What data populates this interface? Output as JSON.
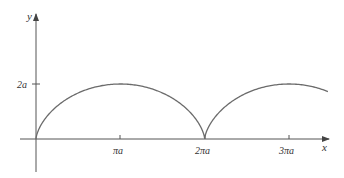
{
  "diagram": {
    "type": "parametric-curve",
    "axes": {
      "x_label": "x",
      "y_label": "y",
      "x_ticks": [
        {
          "label": "πa",
          "value_pi_a": 1
        },
        {
          "label": "2πa",
          "value_pi_a": 2
        },
        {
          "label": "3πa",
          "value_pi_a": 3
        }
      ],
      "y_ticks": [
        {
          "label": "2a",
          "value_a": 2
        }
      ]
    },
    "curve": {
      "color": "#6b6b6b",
      "t_range": [
        0,
        10.5
      ],
      "cusps_at_pi_a": [
        0,
        2
      ],
      "peaks_at_pi_a": [
        1,
        3
      ],
      "peak_height_a": 2
    },
    "colors": {
      "axis": "#555555",
      "curve": "#6b6b6b",
      "text": "#333333"
    }
  },
  "labels": {
    "y_axis": "y",
    "x_axis": "x",
    "tick_2a": "2a",
    "tick_pi_a": "πa",
    "tick_2pi_a": "2πa",
    "tick_3pi_a": "3πa"
  }
}
